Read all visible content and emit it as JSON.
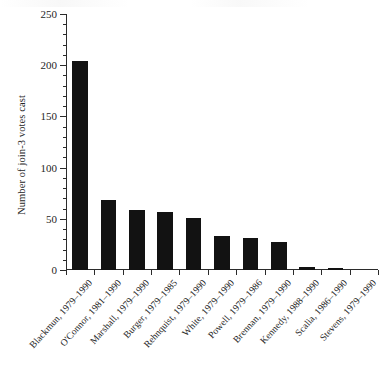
{
  "chart_data": {
    "type": "bar",
    "title": "",
    "xlabel": "",
    "ylabel": "Number of join-3 votes cast",
    "ylim": [
      0,
      250
    ],
    "ytick_values": [
      0,
      50,
      100,
      150,
      200,
      250
    ],
    "ytick_labels": [
      "0",
      "50",
      "100",
      "150",
      "200",
      "250"
    ],
    "minor_tick_interval": 10,
    "grid": false,
    "legend": "none",
    "bar_color": "#121212",
    "axis_color": "#2b2b2b",
    "categories": [
      "Blackmun, 1979–1990",
      "O'Connor, 1981–1990",
      "Marshall, 1979–1990",
      "Burger, 1979–1985",
      "Rehnquist, 1979–1990",
      "White, 1979–1990",
      "Powell, 1979–1986",
      "Brennan, 1979–1990",
      "Kennedy, 1988–1990",
      "Scalia, 1986–1990",
      "Stevens, 1979–1990"
    ],
    "values": [
      204,
      68,
      59,
      57,
      51,
      33,
      31,
      27,
      3,
      2,
      0
    ]
  }
}
